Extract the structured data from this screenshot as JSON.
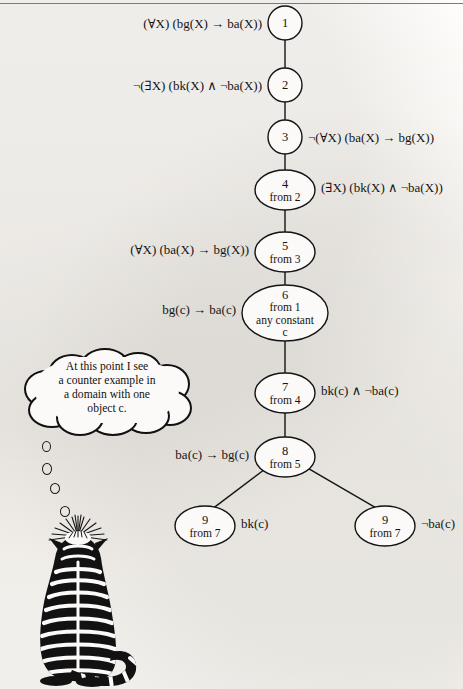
{
  "figure": {
    "kind": "proof-tree-diagram",
    "top_rule_visible": true,
    "background_color": "#fbfaf8",
    "ink_color": "#141414"
  },
  "tree": {
    "nodes": [
      {
        "id": "n1",
        "number": "1",
        "from": "",
        "extra1": "",
        "extra2": "",
        "shape": "circle",
        "cx": 285,
        "cy": 23,
        "rx": 17,
        "ry": 17
      },
      {
        "id": "n2",
        "number": "2",
        "from": "",
        "extra1": "",
        "extra2": "",
        "shape": "circle",
        "cx": 285,
        "cy": 85,
        "rx": 17,
        "ry": 17
      },
      {
        "id": "n3",
        "number": "3",
        "from": "",
        "extra1": "",
        "extra2": "",
        "shape": "circle",
        "cx": 285,
        "cy": 137,
        "rx": 17,
        "ry": 17
      },
      {
        "id": "n4",
        "number": "4",
        "from": "from 2",
        "extra1": "",
        "extra2": "",
        "shape": "ellipse",
        "cx": 285,
        "cy": 190,
        "rx": 30,
        "ry": 20
      },
      {
        "id": "n5",
        "number": "5",
        "from": "from 3",
        "extra1": "",
        "extra2": "",
        "shape": "ellipse",
        "cx": 285,
        "cy": 252,
        "rx": 30,
        "ry": 20
      },
      {
        "id": "n6",
        "number": "6",
        "from": "from 1",
        "extra1": "any constant",
        "extra2": "c",
        "shape": "ellipse",
        "cx": 285,
        "cy": 313,
        "rx": 43,
        "ry": 28
      },
      {
        "id": "n7",
        "number": "7",
        "from": "from 4",
        "extra1": "",
        "extra2": "",
        "shape": "ellipse",
        "cx": 285,
        "cy": 393,
        "rx": 30,
        "ry": 20
      },
      {
        "id": "n8",
        "number": "8",
        "from": "from 5",
        "extra1": "",
        "extra2": "",
        "shape": "ellipse",
        "cx": 285,
        "cy": 457,
        "rx": 30,
        "ry": 20
      },
      {
        "id": "n9a",
        "number": "9",
        "from": "from 7",
        "extra1": "",
        "extra2": "",
        "shape": "ellipse",
        "cx": 205,
        "cy": 526,
        "rx": 30,
        "ry": 20
      },
      {
        "id": "n9b",
        "number": "9",
        "from": "from 7",
        "extra1": "",
        "extra2": "",
        "shape": "ellipse",
        "cx": 385,
        "cy": 526,
        "rx": 30,
        "ry": 20
      }
    ],
    "edges": [
      {
        "from": "n1",
        "to": "n2"
      },
      {
        "from": "n2",
        "to": "n3"
      },
      {
        "from": "n3",
        "to": "n4"
      },
      {
        "from": "n4",
        "to": "n5"
      },
      {
        "from": "n5",
        "to": "n6"
      },
      {
        "from": "n6",
        "to": "n7"
      },
      {
        "from": "n7",
        "to": "n8"
      },
      {
        "from": "n8",
        "to": "n9a"
      },
      {
        "from": "n8",
        "to": "n9b"
      }
    ],
    "labels": [
      {
        "for": "n1",
        "side": "left",
        "text": "(∀X) (bg(X) → ba(X))",
        "x": 262,
        "y": 28
      },
      {
        "for": "n2",
        "side": "left",
        "text": "¬(∃X) (bk(X) ∧ ¬ba(X))",
        "x": 262,
        "y": 90
      },
      {
        "for": "n3",
        "side": "right",
        "text": "¬(∀X) (ba(X) → bg(X))",
        "x": 308,
        "y": 142
      },
      {
        "for": "n4",
        "side": "right",
        "text": "(∃X) (bk(X) ∧ ¬ba(X))",
        "x": 321,
        "y": 192
      },
      {
        "for": "n5",
        "side": "left",
        "text": "(∀X) (ba(X) → bg(X))",
        "x": 249,
        "y": 254
      },
      {
        "for": "n6",
        "side": "left",
        "text": "bg(c) → ba(c)",
        "x": 236,
        "y": 314
      },
      {
        "for": "n7",
        "side": "right",
        "text": "bk(c) ∧ ¬ba(c)",
        "x": 321,
        "y": 395
      },
      {
        "for": "n8",
        "side": "left",
        "text": "ba(c) → bg(c)",
        "x": 249,
        "y": 459
      },
      {
        "for": "n9a",
        "side": "right",
        "text": "bk(c)",
        "x": 241,
        "y": 528
      },
      {
        "for": "n9b",
        "side": "right",
        "text": "¬ba(c)",
        "x": 421,
        "y": 528
      }
    ]
  },
  "thought_bubble": {
    "lines": [
      "At this point I see",
      "a counter example in",
      "a domain with one",
      "object c."
    ],
    "trail_dot_count": 4
  },
  "cat": {
    "description": "striped tabby cat seen from behind looking upward"
  }
}
